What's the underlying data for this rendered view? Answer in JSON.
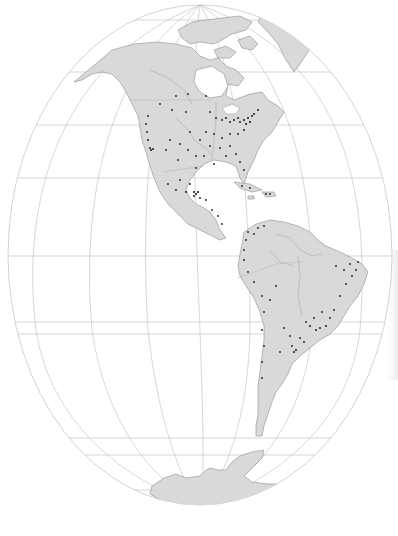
{
  "map": {
    "title": "",
    "projection": "orthographic-ellipse",
    "region": "Americas",
    "colors": {
      "background": "#ffffff",
      "ocean": "#ffffff",
      "land": "#d9d9d9",
      "coastline": "#8e8e8e",
      "graticule": "#bdbdbd",
      "city_dot": "#1a1a1a"
    },
    "globe": {
      "cx": 200,
      "cy": 255,
      "rx": 192,
      "ry": 250
    },
    "layers": [
      "graticule",
      "land",
      "rivers",
      "borders",
      "city-points"
    ],
    "landmasses": [
      "North America",
      "Greenland",
      "Canadian Arctic Archipelago",
      "Central America",
      "Caribbean",
      "South America",
      "Antarctica"
    ],
    "labels": []
  }
}
